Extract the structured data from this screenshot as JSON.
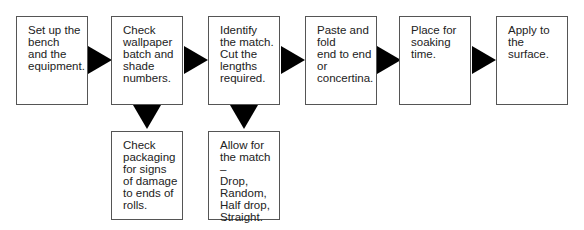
{
  "flow": {
    "steps": [
      {
        "label": "Set up the\nbench\nand the\nequipment."
      },
      {
        "label": "Check\nwallpaper\nbatch and\nshade\nnumbers."
      },
      {
        "label": "Identify\nthe match.\nCut the\nlengths\nrequired."
      },
      {
        "label": "Paste and\nfold\nend to end\nor\nconcertina."
      },
      {
        "label": "Place for\nsoaking\ntime."
      },
      {
        "label": "Apply to\nthe\nsurface."
      }
    ],
    "sub_steps": [
      {
        "label": "Check\npackaging\nfor signs\nof damage\nto ends of\nrolls."
      },
      {
        "label": "Allow for\nthe match –\nDrop,\nRandom,\nHalf drop,\nStraight."
      }
    ]
  },
  "colors": {
    "arrow": "#000000",
    "border": "#555555"
  }
}
